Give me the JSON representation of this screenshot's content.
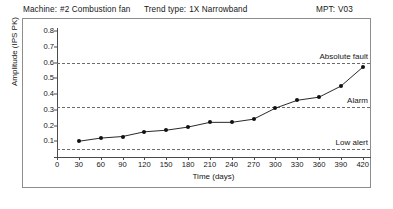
{
  "header": {
    "machine_label": "Machine:",
    "machine_value": "#2  Combustion fan",
    "trend_label": "Trend type:",
    "trend_value": "1X Narrowband",
    "mpt_label": "MPT:",
    "mpt_value": "V03"
  },
  "chart_data": {
    "type": "line",
    "title": "",
    "xlabel": "Time (days)",
    "ylabel": "Amplitude (IPS PK)",
    "xlim": [
      0,
      430
    ],
    "ylim": [
      0,
      0.8
    ],
    "grid": false,
    "legend_position": "none",
    "xticks": [
      0,
      30,
      60,
      90,
      120,
      150,
      180,
      210,
      240,
      270,
      300,
      330,
      360,
      390,
      420
    ],
    "xtick_labels": [
      "0",
      "30",
      "60",
      "90",
      "120",
      "150",
      "180",
      "210",
      "240",
      "270",
      "300",
      "330",
      "360",
      "390",
      "420"
    ],
    "yticks": [
      0.1,
      0.2,
      0.3,
      0.4,
      0.5,
      0.6,
      0.7,
      0.8
    ],
    "ytick_labels": [
      "0.1",
      "0.2",
      "0.3",
      "0.4",
      "0.5",
      "0.6",
      "0.7",
      "0.8"
    ],
    "x": [
      30,
      60,
      90,
      120,
      150,
      180,
      210,
      240,
      270,
      300,
      330,
      360,
      390,
      420
    ],
    "values": [
      0.1,
      0.12,
      0.13,
      0.16,
      0.17,
      0.19,
      0.22,
      0.22,
      0.24,
      0.31,
      0.36,
      0.38,
      0.45,
      0.57
    ],
    "series": [
      {
        "name": "1X Narrowband amplitude",
        "color": "#111111",
        "marker": "circle",
        "values": [
          0.1,
          0.12,
          0.13,
          0.16,
          0.17,
          0.19,
          0.22,
          0.22,
          0.24,
          0.31,
          0.36,
          0.38,
          0.45,
          0.57
        ]
      }
    ],
    "annotations": [
      {
        "label": "Absolute fault",
        "value": 0.6,
        "style": "dashed",
        "color": "#6b6b6b"
      },
      {
        "label": "Alarm",
        "value": 0.32,
        "style": "dashed",
        "color": "#6b6b6b"
      },
      {
        "label": "Low alert",
        "value": 0.05,
        "style": "dashed",
        "color": "#6b6b6b"
      }
    ]
  }
}
